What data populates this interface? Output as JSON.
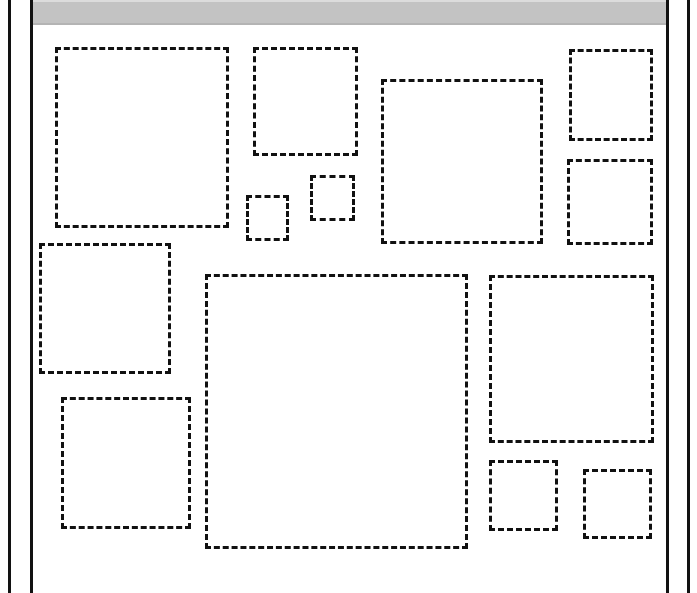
{
  "page": {
    "width": 697,
    "height": 593,
    "background_color": "#ffffff"
  },
  "header_band": {
    "name": "page-header-band",
    "color": "#c3c3c3",
    "highlight_color": "#dcdcdc",
    "shadow_color": "#b4b4b4",
    "x": 30,
    "y": 0,
    "width": 636,
    "height": 25
  },
  "frame": {
    "line_color": "#121212",
    "rules": [
      {
        "name": "outer-left-rule",
        "orientation": "vertical",
        "x": 8,
        "y": 0,
        "thickness": 3,
        "length": 593
      },
      {
        "name": "inner-left-rule",
        "orientation": "vertical",
        "x": 30,
        "y": 0,
        "thickness": 3,
        "length": 593
      },
      {
        "name": "inner-right-rule",
        "orientation": "vertical",
        "x": 666,
        "y": 0,
        "thickness": 3,
        "length": 593
      },
      {
        "name": "outer-right-rule",
        "orientation": "vertical",
        "x": 687,
        "y": 0,
        "thickness": 3,
        "length": 593
      }
    ]
  },
  "regions": {
    "stroke_color": "#111111",
    "stroke_width": 3,
    "dash_style": "dashed",
    "count": 14,
    "boxes": [
      {
        "name": "region-box-top-left-large",
        "x": 55,
        "y": 47,
        "width": 174,
        "height": 181
      },
      {
        "name": "region-box-top-column",
        "x": 253,
        "y": 47,
        "width": 105,
        "height": 109
      },
      {
        "name": "region-box-top-center-large",
        "x": 381,
        "y": 79,
        "width": 162,
        "height": 165
      },
      {
        "name": "region-box-top-right-upper",
        "x": 569,
        "y": 49,
        "width": 84,
        "height": 92
      },
      {
        "name": "region-box-top-right-lower",
        "x": 567,
        "y": 159,
        "width": 86,
        "height": 86
      },
      {
        "name": "region-box-small-inline-left",
        "x": 246,
        "y": 195,
        "width": 43,
        "height": 46
      },
      {
        "name": "region-box-small-inline-right",
        "x": 310,
        "y": 175,
        "width": 45,
        "height": 46
      },
      {
        "name": "region-box-mid-left",
        "x": 39,
        "y": 243,
        "width": 132,
        "height": 131
      },
      {
        "name": "region-box-center-largest",
        "x": 205,
        "y": 274,
        "width": 263,
        "height": 275
      },
      {
        "name": "region-box-mid-right",
        "x": 489,
        "y": 275,
        "width": 165,
        "height": 168
      },
      {
        "name": "region-box-bottom-left",
        "x": 61,
        "y": 397,
        "width": 130,
        "height": 132
      },
      {
        "name": "region-box-bottom-right-small-a",
        "x": 489,
        "y": 460,
        "width": 69,
        "height": 71
      },
      {
        "name": "region-box-bottom-right-small-b",
        "x": 583,
        "y": 469,
        "width": 69,
        "height": 70
      }
    ]
  }
}
